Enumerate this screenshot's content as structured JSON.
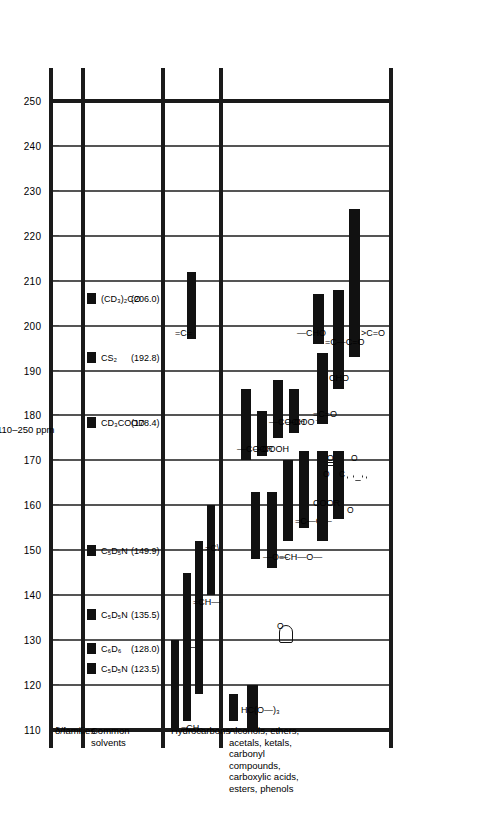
{
  "figure": {
    "axis_title": "110–250 ppm",
    "units": "ppm"
  },
  "columns": [
    {
      "id": "families",
      "label": "δ/families"
    },
    {
      "id": "solvents",
      "label": "Common\nsolvents"
    },
    {
      "id": "hydrocarbons",
      "label": "Hydrocarbons"
    },
    {
      "id": "oxygenated",
      "label": "Alcohols, ethers,\nacetals, ketals,\ncarbonyl\ncompounds,\ncarboxylic acids,\nesters, phenols"
    }
  ],
  "chart_data": {
    "type": "bar",
    "xlabel": "110–250 ppm",
    "ylabel": "",
    "xlim": [
      110,
      250
    ],
    "grid": true,
    "tick_step": 10,
    "tick_labels": [
      "110",
      "120",
      "130",
      "140",
      "150",
      "160",
      "170",
      "180",
      "190",
      "200",
      "210",
      "220",
      "230",
      "240",
      "250"
    ],
    "legend": "none",
    "series": [
      {
        "name": "Common solvents",
        "kind": "solvent-lines",
        "values": [
          {
            "label": "C₅D₅N",
            "shift_text": "(123.5)",
            "shift": 123.5
          },
          {
            "label": "C₆D₆",
            "shift_text": "(128.0)",
            "shift": 128.0
          },
          {
            "label": "C₅D₅N",
            "shift_text": "(135.5)",
            "shift": 135.5
          },
          {
            "label": "C₅D₅N",
            "shift_text": "(149.9)",
            "shift": 149.9
          },
          {
            "label": "CD₃COOD",
            "shift_text": "(178.4)",
            "shift": 178.4
          },
          {
            "label": "CS₂",
            "shift_text": "(192.8)",
            "shift": 192.8
          },
          {
            "label": "(CD₃)₂CO",
            "shift_text": "(206.0)",
            "shift": 206.0
          }
        ]
      },
      {
        "name": "Hydrocarbons",
        "kind": "ranges",
        "values": [
          {
            "label": "=CH₂",
            "from": 110,
            "to": 130
          },
          {
            "label": "aromatic-ring",
            "from": 112,
            "to": 145
          },
          {
            "label": "benzene-ring-glyph",
            "from": 125,
            "to": 132
          },
          {
            "label": "=CH—",
            "from": 118,
            "to": 152
          },
          {
            "label": "=C<",
            "from": 140,
            "to": 160
          },
          {
            "label": "=C=",
            "from": 197,
            "to": 212
          }
        ]
      },
      {
        "name": "Alcohols, ethers, acetals, ketals, carbonyl compounds, carboxylic acids, esters, phenols",
        "kind": "ranges",
        "values": [
          {
            "label": "HC(O—)₃",
            "from": 112,
            "to": 118
          },
          {
            "label": "acetal-ketal",
            "from": 110,
            "to": 120
          },
          {
            "label": "cyclic-ether-glyph",
            "from": 131,
            "to": 133
          },
          {
            "label": "—O— ester O",
            "from": 148,
            "to": 163
          },
          {
            "label": "=CH—O—",
            "from": 146,
            "to": 163
          },
          {
            "label": "=C—O—",
            "from": 152,
            "to": 170
          },
          {
            "label": "=C(O—)",
            "from": 155,
            "to": 172
          },
          {
            "label": "phenol-ring-glyph",
            "from": 157,
            "to": 172
          },
          {
            "label": "—COOR",
            "from": 152,
            "to": 172
          },
          {
            "label": "C=O carbonate",
            "from": 155,
            "to": 170
          },
          {
            "label": "—COOR",
            "from": 170,
            "to": 186
          },
          {
            "label": "—COOH",
            "from": 171,
            "to": 181
          },
          {
            "label": "—COOH",
            "from": 175,
            "to": 188
          },
          {
            "label": "—COO⁻",
            "from": 176,
            "to": 186
          },
          {
            "label": "=C=O ketene",
            "from": 178,
            "to": 194
          },
          {
            "label": "CHO aryl",
            "from": 186,
            "to": 196
          },
          {
            "label": ">C=O ketone",
            "from": 193,
            "to": 226
          },
          {
            "label": "=C—C=O enone",
            "from": 192,
            "to": 208
          },
          {
            "label": "—CHO aldehyde",
            "from": 196,
            "to": 207
          }
        ]
      }
    ],
    "annotations": [
      "=CH₂",
      "=CH—",
      "=C<",
      "=C=",
      "HC(O—)₃",
      "—O—",
      "=CH—O—",
      "C—O—",
      "—COOR",
      "—COOH",
      "—COO⁻",
      "COOR",
      "=C=O",
      "CHO",
      ">C=O",
      "—CHO"
    ]
  },
  "annotations": {
    "ch2": "=CH₂",
    "chdash": "=CH—",
    "cfork": "=C\\",
    "ceq": "=C=",
    "hco3": "HC(O—)₃",
    "o_single": "—O—",
    "ch_o": "=CH—O—",
    "c_o": "=C—O—",
    "coor_a": "—COOR",
    "coor_b": "COOR",
    "cooh_a": "—COOH",
    "cooh_b": "—COOH",
    "coo_minus": "—COO⁻",
    "cco": "=C=O",
    "cho_a": "CHO",
    "cho_b": "—CHO",
    "ketone": ">C=O",
    "enone": "=C—C=O",
    "carbonate_c": "C",
    "carbonate_o_top": "O",
    "carbonate_o_l": "O",
    "carbonate_o_r": "O",
    "phenol_o": "O",
    "ether_o": "O"
  },
  "colors": {
    "ink": "#111111",
    "rule": "#1a1a1a",
    "grid": "#555555",
    "background": "#ffffff"
  }
}
